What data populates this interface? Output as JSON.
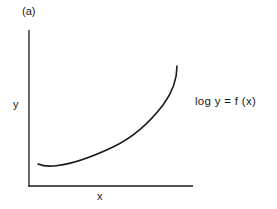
{
  "figure": {
    "panel_label": "(a)",
    "y_axis_label": "y",
    "x_axis_label": "x",
    "equation": "log y = f (x)",
    "line_color": "#1a1a1a"
  },
  "curve": {
    "description": "Convex increasing curve with slight dip near origin, steepening sharply at right",
    "points": [
      [
        38,
        164
      ],
      [
        53,
        166
      ],
      [
        83,
        160
      ],
      [
        113,
        147
      ],
      [
        143,
        128
      ],
      [
        165,
        103
      ],
      [
        177,
        66
      ]
    ]
  }
}
